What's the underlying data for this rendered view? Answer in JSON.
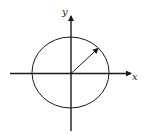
{
  "diagram": {
    "type": "unit-circle-with-radius",
    "axes": {
      "x_label": "x",
      "y_label": "y"
    },
    "colors": {
      "stroke": "#1a1a1a",
      "background": "#ffffff"
    }
  }
}
